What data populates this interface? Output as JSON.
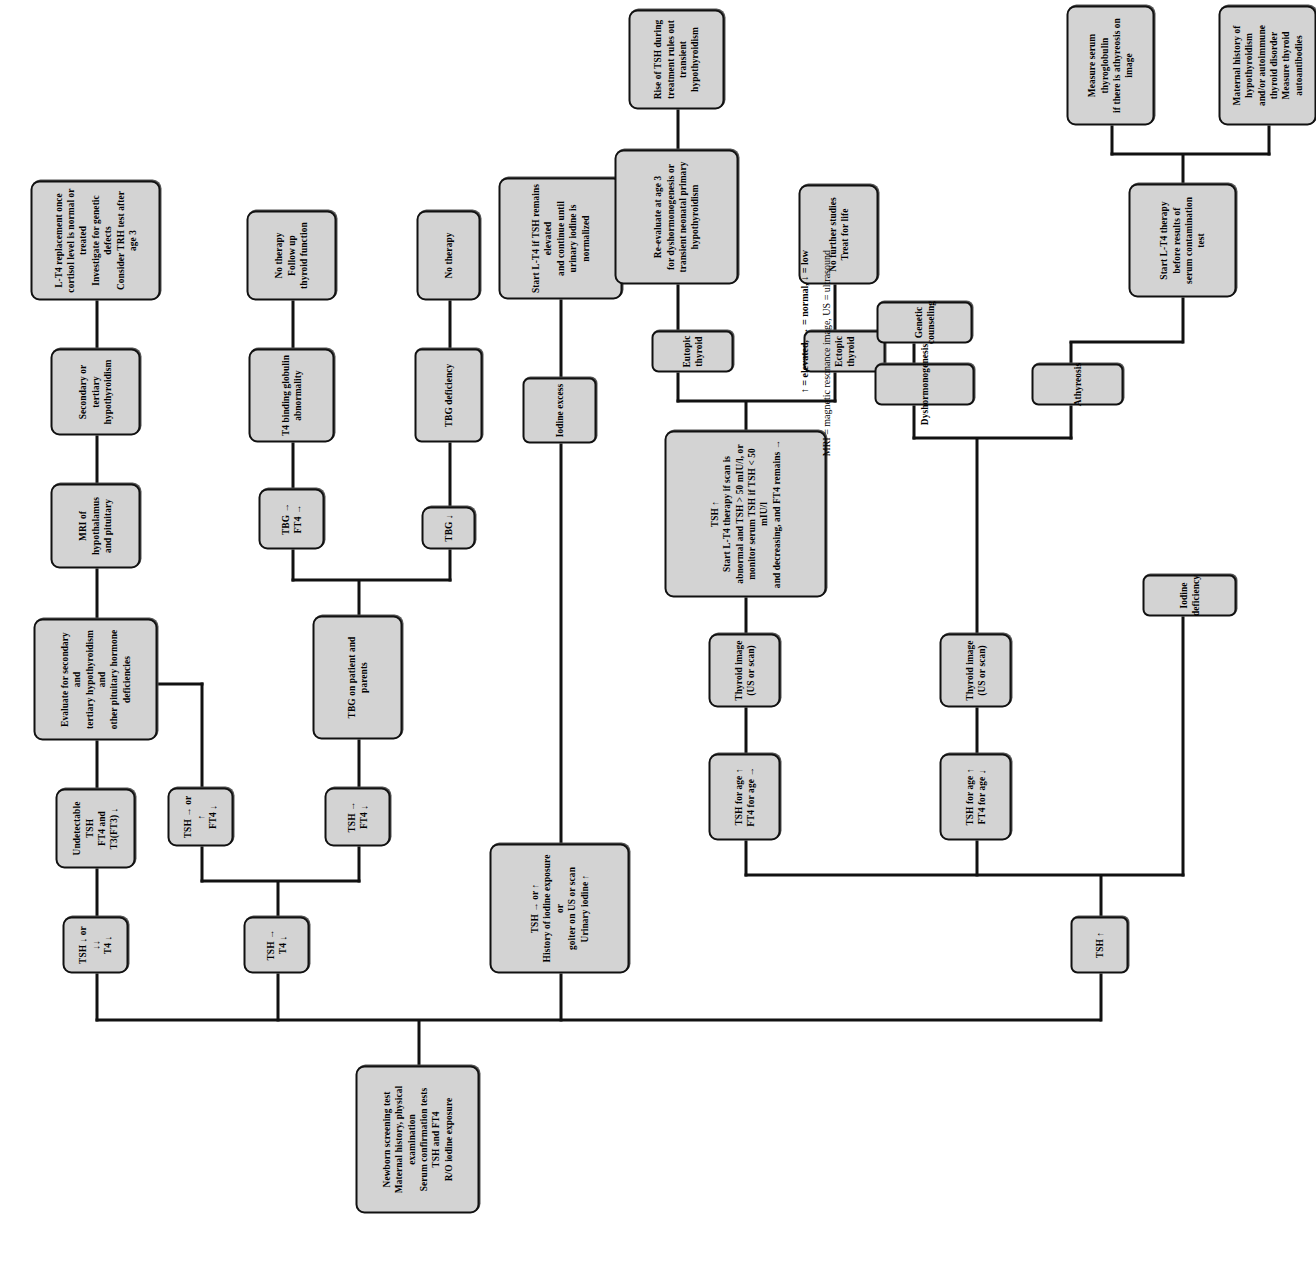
{
  "diagram": {
    "root": {
      "id": "root",
      "label": "Newborn screening test\nMaternal history, physical examination\nSerum confirmation tests\nTSH and FT4\nR/O iodine exposure"
    },
    "branches": {
      "tsh_low": {
        "label": "TSH ↓ or ↓↓\nT4 ↓"
      },
      "tsh_norm": {
        "label": "TSH →\nT4 ↓"
      },
      "tsh_iodine": {
        "label": "TSH → or ↑\nHistory of iodine exposure or\ngoiter on US or scan\nUrinary iodine ↑"
      },
      "tsh_high": {
        "label": "TSH ↑"
      }
    },
    "nodes": [
      {
        "id": "undetectable_tsh",
        "label": "Undetectable TSH\nFT4 and T3(FT3) ↓"
      },
      {
        "id": "evaluate_secondary",
        "label": "Evaluate for secondary and\ntertiary hypothyroidism and\nother pituitary hormone\ndeficiencies"
      },
      {
        "id": "mri",
        "label": "MRI of hypothalamus\nand pituitary"
      },
      {
        "id": "secondary_tertiary",
        "label": "Secondary or tertiary\nhypothyroidism"
      },
      {
        "id": "lt4_replacement",
        "label": "L-T4 replacement once\ncortisol level is normal or treated\nInvestigate for genetic defects\nConsider TRH test after age 3"
      },
      {
        "id": "tsh_norm_ft4_low",
        "label": "TSH → or ↑\nFT4 ↓"
      },
      {
        "id": "tsh_norm_ft4_low2",
        "label": "TSH →\nFT4 ↓"
      },
      {
        "id": "tbg_patient_parents",
        "label": "TBG on patient and parents"
      },
      {
        "id": "tbg_norm",
        "label": "TBG →\nFT4 →"
      },
      {
        "id": "tbg_low",
        "label": "TBG ↓"
      },
      {
        "id": "t4_binding_globulin",
        "label": "T4 binding globulin\nabnormality"
      },
      {
        "id": "tbg_deficiency",
        "label": "TBG deficiency"
      },
      {
        "id": "no_therapy_followup",
        "label": "No therapy\nFollow up\nthyroid function"
      },
      {
        "id": "no_therapy",
        "label": "No therapy"
      },
      {
        "id": "iodine_excess",
        "label": "Iodine excess"
      },
      {
        "id": "start_lt4_iodine",
        "label": "Start L-T4 if TSH remains elevated\nand continue until\nurinary iodine is normalized"
      },
      {
        "id": "tsh_high_ft4_norm",
        "label": "TSH  for age ↑\nFT4 for age →"
      },
      {
        "id": "thyroid_image_1",
        "label": "Thyroid image\n(US or scan)"
      },
      {
        "id": "tsh_up_start",
        "label": "TSH ↑\nStart L-T4 therapy if scan is\nabnormal and TSH > 50 mIU/l, or\nmonitor serum TSH if TSH < 50 mIU/l\nand decreasing, and FT4 remains →"
      },
      {
        "id": "eutopic_thyroid",
        "label": "Eutopic thyroid"
      },
      {
        "id": "ectopic_thyroid",
        "label": "Ectopic thyroid"
      },
      {
        "id": "reevaluate_age3",
        "label": "Re-evaluate at age 3\nfor dyshormonogenesis or\ntransient neonatal primary\nhypothyroidism"
      },
      {
        "id": "rise_tsh",
        "label": "Rise of TSH during\ntreatment rules out\ntransient hypothyroidism"
      },
      {
        "id": "no_further_studies",
        "label": "No further studies\nTreat for life"
      },
      {
        "id": "tsh_high_ft4_low",
        "label": "TSH for age ↑\nFT4 for age ↓"
      },
      {
        "id": "thyroid_image_2",
        "label": "Thyroid image\n(US or scan)"
      },
      {
        "id": "dyshormonogenesis",
        "label": "Dyshormonogenesis"
      },
      {
        "id": "athyreosis",
        "label": "Athyreosis"
      },
      {
        "id": "iodine_deficiency",
        "label": "Iodine deficiency"
      },
      {
        "id": "genetic_counseling",
        "label": "Genetic counseling"
      },
      {
        "id": "start_lt4_before",
        "label": "Start L-T4 therapy\nbefore results of\nserum contamination test"
      },
      {
        "id": "measure_thyroglobulin",
        "label": "Measure serum thyroglobulin\nif there is athyreosis on image"
      },
      {
        "id": "maternal_history",
        "label": "Maternal history of hypothyroidism\nand/or autoimmune thyroid disorder\nMeasure thyroid autoantibodies"
      }
    ],
    "legend": {
      "line1": "↑ = elevated, → = normal, ↓ = low",
      "line2": "MRI = magnetic resonance image, US = ultrasound"
    },
    "colors": {
      "node_fill": "#d3d3d3",
      "node_border": "#111111",
      "edge": "#111111",
      "background": "#ffffff"
    }
  }
}
